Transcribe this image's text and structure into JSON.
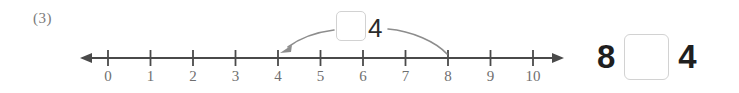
{
  "problem": {
    "number_label": "(3)"
  },
  "number_line": {
    "min": 0,
    "max": 10,
    "tick_labels": [
      "0",
      "1",
      "2",
      "3",
      "4",
      "5",
      "6",
      "7",
      "8",
      "9",
      "10"
    ],
    "axis_color": "#4a4a4a",
    "label_color": "#6f6f6f",
    "left_arrow": "left-arrowhead",
    "right_arrow": "right-arrowhead",
    "jump": {
      "from_value": 4,
      "to_value": 8,
      "arrow_to_start_icon": "curved-arrow-left",
      "arrow_to_end_icon": "curved-arrow-right"
    }
  },
  "jump_label": {
    "answer_box_value": "",
    "operand": "4"
  },
  "equation": {
    "left_operand": "8",
    "operator_box_value": "",
    "right_operand": "4"
  },
  "colors": {
    "box_border": "#d2d2d2",
    "ink": "#2b2b2b",
    "axis": "#4a4a4a"
  }
}
